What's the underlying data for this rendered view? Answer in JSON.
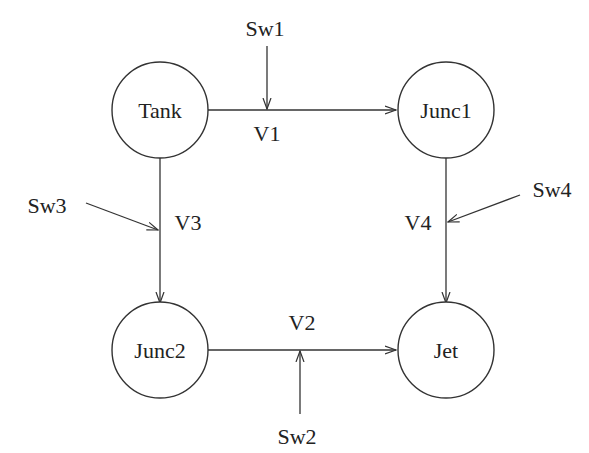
{
  "diagram": {
    "type": "flow-network",
    "nodes": [
      {
        "id": "tank",
        "label": "Tank",
        "cx": 160,
        "cy": 110
      },
      {
        "id": "junc1",
        "label": "Junc1",
        "cx": 445,
        "cy": 110
      },
      {
        "id": "junc2",
        "label": "Junc2",
        "cx": 160,
        "cy": 352
      },
      {
        "id": "jet",
        "label": "Jet",
        "cx": 445,
        "cy": 352
      }
    ],
    "edges": [
      {
        "id": "v1",
        "label": "V1",
        "from": "Tank",
        "to": "Junc1"
      },
      {
        "id": "v3",
        "label": "V3",
        "from": "Tank",
        "to": "Junc2"
      },
      {
        "id": "v4",
        "label": "V4",
        "from": "Junc1",
        "to": "Jet"
      },
      {
        "id": "v2",
        "label": "V2",
        "from": "Junc2",
        "to": "Jet"
      }
    ],
    "switches": [
      {
        "id": "sw1",
        "label": "Sw1",
        "controls": "V1"
      },
      {
        "id": "sw2",
        "label": "Sw2",
        "controls": "V2"
      },
      {
        "id": "sw3",
        "label": "Sw3",
        "controls": "V3"
      },
      {
        "id": "sw4",
        "label": "Sw4",
        "controls": "V4"
      }
    ]
  },
  "labels": {
    "tank": "Tank",
    "junc1": "Junc1",
    "junc2": "Junc2",
    "jet": "Jet",
    "v1": "V1",
    "v2": "V2",
    "v3": "V3",
    "v4": "V4",
    "sw1": "Sw1",
    "sw2": "Sw2",
    "sw3": "Sw3",
    "sw4": "Sw4"
  }
}
